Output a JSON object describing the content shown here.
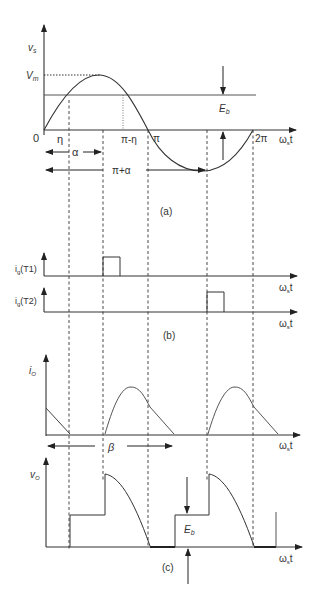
{
  "figure": {
    "panel_a": {
      "y_label": "v",
      "y_label_sub": "s",
      "vm_label": "V",
      "vm_label_sub": "m",
      "eb_label": "E",
      "eb_label_sub": "b",
      "origin_label": "0",
      "eta_label": "η",
      "pi_minus_eta_label": "π-η",
      "pi_label": "π",
      "two_pi_label": "2π",
      "alpha_label": "α",
      "pi_plus_alpha_label": "π+α",
      "x_axis_label": "ω",
      "x_axis_label_sub": "s",
      "x_axis_label_suffix": "t",
      "caption": "(a)"
    },
    "panel_b": {
      "t1_label": "i",
      "t1_label_sub": "g",
      "t1_label_suffix": "(T1)",
      "t2_label": "i",
      "t2_label_sub": "g",
      "t2_label_suffix": "(T2)",
      "x_axis_label": "ω",
      "x_axis_label_sub": "s",
      "x_axis_label_suffix": "t",
      "caption": "(b)"
    },
    "panel_c": {
      "io_label": "i",
      "io_label_sub": "O",
      "beta_label": "β",
      "vo_label": "v",
      "vo_label_sub": "O",
      "eb_label": "E",
      "eb_label_sub": "b",
      "x_axis_label": "ω",
      "x_axis_label_sub": "s",
      "x_axis_label_suffix": "t",
      "caption": "(c)"
    }
  }
}
